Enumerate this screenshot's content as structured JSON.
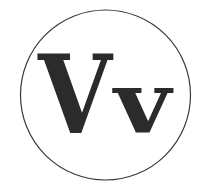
{
  "logo": {
    "big_letter": "V",
    "small_letter": "v",
    "ink_color": "#2b2b2b",
    "ring_color": "#3a3a3a",
    "background": "#ffffff"
  }
}
